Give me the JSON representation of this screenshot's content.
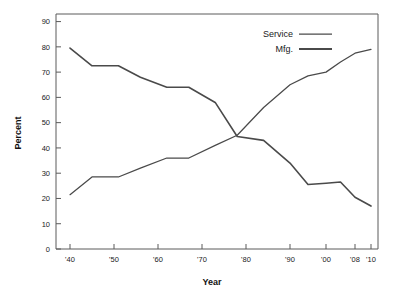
{
  "chart_data": {
    "type": "line",
    "title": "",
    "xlabel": "Year",
    "ylabel": "Percent",
    "xlim": [
      1940,
      2010
    ],
    "ylim": [
      0,
      93
    ],
    "grid": false,
    "legend_position": "top-right",
    "xtick_labels": [
      "'40",
      "'50",
      "'60",
      "'70",
      "'80",
      "'90",
      "'00",
      "'08",
      "'10"
    ],
    "xtick_values": [
      1940,
      1950,
      1960,
      1970,
      1980,
      1990,
      2000,
      2008,
      2010
    ],
    "ytick_labels": [
      "0",
      "10",
      "20",
      "30",
      "40",
      "50",
      "60",
      "70",
      "80",
      "90"
    ],
    "ytick_values": [
      0,
      10,
      20,
      30,
      40,
      50,
      60,
      70,
      80,
      90
    ],
    "series": [
      {
        "name": "Service",
        "style": "thin",
        "x": [
          1940,
          1945,
          1951,
          1956,
          1962,
          1967,
          1973,
          1978,
          1984,
          1990,
          1995,
          2000,
          2004,
          2008,
          2010
        ],
        "values": [
          21.5,
          28.5,
          28.5,
          32,
          36,
          36,
          41,
          45,
          56,
          65,
          68.5,
          70,
          74,
          77.5,
          79
        ]
      },
      {
        "name": "Mfg.",
        "style": "thick",
        "x": [
          1940,
          1945,
          1951,
          1956,
          1962,
          1967,
          1973,
          1978,
          1984,
          1990,
          1995,
          2000,
          2004,
          2008,
          2010
        ],
        "values": [
          79.5,
          72.5,
          72.5,
          68,
          64,
          64,
          58,
          44.5,
          43,
          34,
          25.5,
          26,
          26.5,
          20.5,
          17
        ]
      }
    ]
  },
  "legend": {
    "entries": [
      {
        "label": "Service"
      },
      {
        "label": "Mfg."
      }
    ]
  },
  "axes": {
    "y_title": "Percent",
    "x_title": "Year"
  }
}
